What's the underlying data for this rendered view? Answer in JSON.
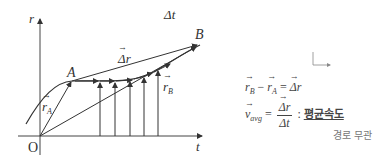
{
  "diagram": {
    "axes": {
      "y_label": "r",
      "x_label": "t",
      "origin_label": "O"
    },
    "points": {
      "A": "A",
      "B": "B"
    },
    "labels": {
      "delta_t": "Δt",
      "delta_r": "Δr",
      "r_A": "r",
      "r_A_sub": "A",
      "r_B": "r",
      "r_B_sub": "B"
    }
  },
  "equations": {
    "eq1": {
      "rB": "r",
      "rB_sub": "B",
      "minus": "−",
      "rA": "r",
      "rA_sub": "A",
      "equals": "=",
      "result": "Δr"
    },
    "eq2": {
      "v": "v",
      "v_sub": "avg",
      "equals": "=",
      "num": "Δr",
      "den": "Δt",
      "colon": ":",
      "meaning": "평균속도"
    },
    "note": "경로 무관"
  },
  "colors": {
    "line": "#333333",
    "text": "#444444",
    "note": "#888888"
  }
}
